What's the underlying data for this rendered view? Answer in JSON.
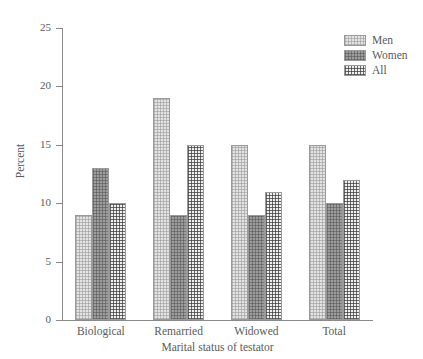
{
  "chart_data": {
    "type": "bar",
    "title": "",
    "xlabel": "Marital status of testator",
    "ylabel": "Percent",
    "categories": [
      "Biological",
      "Remarried",
      "Widowed",
      "Total"
    ],
    "series": [
      {
        "name": "Men",
        "values": [
          9,
          19,
          15,
          15
        ],
        "color": "#e3e3e3",
        "pattern": "light-dotted"
      },
      {
        "name": "Women",
        "values": [
          13,
          9,
          9,
          10
        ],
        "color": "#9d9d9d",
        "pattern": "dark-dotted"
      },
      {
        "name": "All",
        "values": [
          10,
          15,
          11,
          12
        ],
        "color": "#f0f0f0",
        "pattern": "crosshatch"
      }
    ],
    "ylim": [
      0,
      25
    ],
    "yticks": [
      0,
      5,
      10,
      15,
      20,
      25
    ],
    "ytick_labels": [
      "0",
      "5",
      "10",
      "15",
      "20",
      "25"
    ],
    "grid": false,
    "legend_position": "top-right",
    "legend_entries": [
      "Men",
      "Women",
      "All"
    ]
  }
}
